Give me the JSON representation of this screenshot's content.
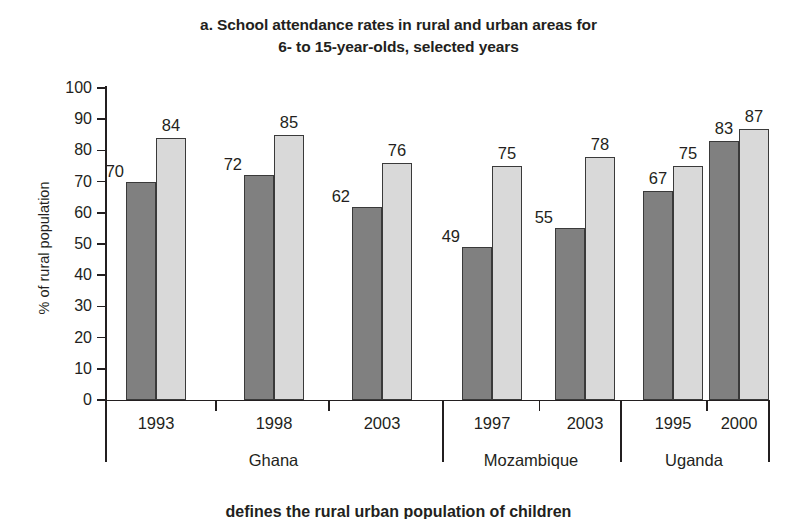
{
  "chart_data": {
    "type": "bar",
    "title": "a. School attendance rates in rural and urban areas for 6- to 15-year-olds, selected years",
    "title_line1": "a. School attendance rates in rural and urban areas for",
    "title_line2": "6- to 15-year-olds, selected years",
    "xlabel": "",
    "ylabel": "% of rural population",
    "ylim": [
      0,
      100
    ],
    "ytick_labels": [
      "100",
      "90",
      "80",
      "70",
      "60",
      "50",
      "40",
      "30",
      "20",
      "10",
      "0"
    ],
    "ytick_values": [
      100,
      90,
      80,
      70,
      60,
      50,
      40,
      30,
      20,
      10,
      0
    ],
    "grid": false,
    "legend_position": "none",
    "categories": [
      "1993",
      "1998",
      "2003",
      "1997",
      "2003",
      "1995",
      "2000"
    ],
    "series": [
      {
        "name": "rural",
        "color": "#808080",
        "values": [
          70,
          72,
          62,
          49,
          55,
          67,
          83
        ]
      },
      {
        "name": "urban",
        "color": "#d9d9d9",
        "values": [
          84,
          85,
          76,
          75,
          78,
          75,
          87
        ]
      }
    ],
    "groups": [
      {
        "country": "Ghana",
        "years": [
          "1993",
          "1998",
          "2003"
        ]
      },
      {
        "country": "Mozambique",
        "years": [
          "1997",
          "2003"
        ]
      },
      {
        "country": "Uganda",
        "years": [
          "1995",
          "2000"
        ]
      }
    ],
    "bars": [
      {
        "country": "Ghana",
        "year": "1993",
        "rural": 70,
        "urban": 84
      },
      {
        "country": "Ghana",
        "year": "1998",
        "rural": 72,
        "urban": 85
      },
      {
        "country": "Ghana",
        "year": "2003",
        "rural": 62,
        "urban": 76
      },
      {
        "country": "Mozambique",
        "year": "1997",
        "rural": 49,
        "urban": 75
      },
      {
        "country": "Mozambique",
        "year": "2003",
        "rural": 55,
        "urban": 78
      },
      {
        "country": "Uganda",
        "year": "1995",
        "rural": 67,
        "urban": 75
      },
      {
        "country": "Uganda",
        "year": "2000",
        "rural": 83,
        "urban": 87
      }
    ]
  },
  "bottom_caption": "defines the rural urban population of children",
  "colors": {
    "rural_bar": "#808080",
    "urban_bar": "#d9d9d9",
    "bar_outline": "#3a3a3a",
    "text": "#231f20",
    "background": "#ffffff"
  }
}
